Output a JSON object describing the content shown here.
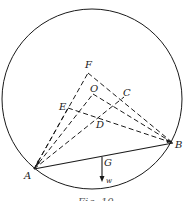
{
  "figure": {
    "caption": "Fig. 10",
    "stroke_color": "#1a1a1a",
    "circle": {
      "cx": 92,
      "cy": 99,
      "r": 90
    },
    "points": {
      "A": {
        "label": "A",
        "x": 34,
        "y": 169
      },
      "B": {
        "label": "B",
        "x": 173,
        "y": 143
      },
      "F": {
        "label": "F",
        "x": 88,
        "y": 73
      },
      "O": {
        "label": "O",
        "x": 93,
        "y": 94
      },
      "E": {
        "label": "E",
        "x": 68,
        "y": 108
      },
      "C": {
        "label": "C",
        "x": 124,
        "y": 97
      },
      "D": {
        "label": "D",
        "x": 97,
        "y": 117
      },
      "G": {
        "label": "G",
        "x": 102,
        "y": 157
      }
    },
    "weight": {
      "label": "w",
      "from_y": 157,
      "to_y": 181
    },
    "solid_lines": [
      [
        "A",
        "B"
      ]
    ],
    "dashed_lines": [
      [
        "A",
        "F"
      ],
      [
        "F",
        "B"
      ],
      [
        "A",
        "O"
      ],
      [
        "O",
        "B"
      ],
      [
        "A",
        "E"
      ],
      [
        "E",
        "B"
      ],
      [
        "A",
        "C"
      ]
    ]
  }
}
